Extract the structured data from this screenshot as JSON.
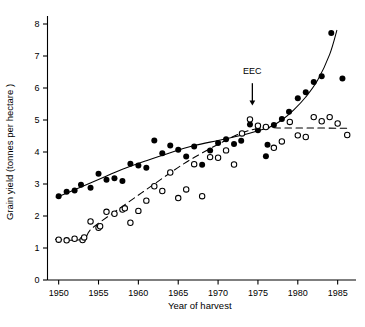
{
  "chart_data": {
    "type": "scatter",
    "title": "",
    "xlabel": "Year of harvest",
    "ylabel": "Grain yield (tonnes per hectare )",
    "xlim": [
      1948.6,
      1986.8
    ],
    "ylim": [
      0,
      8
    ],
    "grid": false,
    "legend_position": "none",
    "xticks": [
      1950,
      1955,
      1960,
      1965,
      1970,
      1975,
      1980,
      1985
    ],
    "xtick_labels": [
      "1950",
      "1955",
      "1960",
      "1965",
      "1970",
      "1975",
      "1980",
      "1985"
    ],
    "yticks": [
      0,
      1,
      2,
      3,
      4,
      5,
      6,
      7,
      8
    ],
    "ytick_labels": [
      "0",
      "1",
      "2",
      "3",
      "4",
      "5",
      "6",
      "7",
      "8"
    ],
    "annotations": [
      {
        "text": "EEC",
        "x": 1974.3,
        "y": 6.45,
        "arrow": "down",
        "arrow_from_y": 6.15,
        "arrow_to_y": 5.45
      }
    ],
    "series": [
      {
        "name": "filled-circles",
        "marker": "filled-circle",
        "marker_color": "#000000",
        "points": [
          [
            1950.0,
            2.62
          ],
          [
            1951.0,
            2.76
          ],
          [
            1952.0,
            2.8
          ],
          [
            1952.8,
            2.98
          ],
          [
            1954.0,
            2.88
          ],
          [
            1955.0,
            3.32
          ],
          [
            1956.0,
            3.13
          ],
          [
            1957.0,
            3.18
          ],
          [
            1958.0,
            3.09
          ],
          [
            1959.0,
            3.63
          ],
          [
            1960.0,
            3.58
          ],
          [
            1961.0,
            3.51
          ],
          [
            1962.0,
            4.36
          ],
          [
            1963.0,
            3.96
          ],
          [
            1964.0,
            4.2
          ],
          [
            1965.0,
            4.07
          ],
          [
            1966.0,
            3.86
          ],
          [
            1967.0,
            4.17
          ],
          [
            1968.0,
            3.6
          ],
          [
            1969.0,
            4.05
          ],
          [
            1970.0,
            4.28
          ],
          [
            1971.0,
            4.4
          ],
          [
            1972.0,
            4.25
          ],
          [
            1972.9,
            4.35
          ],
          [
            1974.0,
            4.86
          ],
          [
            1975.0,
            4.68
          ],
          [
            1976.0,
            3.87
          ],
          [
            1976.2,
            4.23
          ],
          [
            1977.0,
            4.84
          ],
          [
            1978.0,
            5.03
          ],
          [
            1978.9,
            5.26
          ],
          [
            1980.0,
            5.68
          ],
          [
            1981.0,
            5.87
          ],
          [
            1982.0,
            6.19
          ],
          [
            1983.0,
            6.37
          ],
          [
            1984.2,
            7.72
          ],
          [
            1985.6,
            6.3
          ]
        ]
      },
      {
        "name": "open-circles",
        "marker": "open-circle",
        "marker_color": "#000000",
        "points": [
          [
            1950.0,
            1.26
          ],
          [
            1951.0,
            1.24
          ],
          [
            1952.0,
            1.29
          ],
          [
            1953.0,
            1.25
          ],
          [
            1953.2,
            1.33
          ],
          [
            1954.0,
            1.83
          ],
          [
            1955.0,
            1.63
          ],
          [
            1955.2,
            1.68
          ],
          [
            1956.0,
            2.13
          ],
          [
            1957.0,
            2.07
          ],
          [
            1958.0,
            2.2
          ],
          [
            1958.3,
            2.24
          ],
          [
            1959.0,
            1.79
          ],
          [
            1960.0,
            2.16
          ],
          [
            1961.0,
            2.48
          ],
          [
            1962.0,
            2.93
          ],
          [
            1963.0,
            2.78
          ],
          [
            1964.0,
            3.36
          ],
          [
            1965.0,
            2.56
          ],
          [
            1966.0,
            2.83
          ],
          [
            1967.0,
            3.62
          ],
          [
            1968.0,
            2.62
          ],
          [
            1969.0,
            3.84
          ],
          [
            1970.0,
            3.82
          ],
          [
            1971.0,
            4.05
          ],
          [
            1972.0,
            3.61
          ],
          [
            1973.0,
            4.58
          ],
          [
            1974.0,
            5.02
          ],
          [
            1975.0,
            4.82
          ],
          [
            1976.0,
            4.78
          ],
          [
            1977.0,
            4.13
          ],
          [
            1978.0,
            4.33
          ],
          [
            1979.0,
            4.94
          ],
          [
            1980.0,
            4.52
          ],
          [
            1981.0,
            4.47
          ],
          [
            1982.0,
            5.09
          ],
          [
            1983.0,
            4.96
          ],
          [
            1984.0,
            5.09
          ],
          [
            1985.0,
            4.89
          ],
          [
            1986.2,
            4.53
          ]
        ]
      }
    ],
    "fitted_curves": [
      {
        "name": "solid-trend-line",
        "style": "solid",
        "color": "#000000",
        "points": [
          [
            1949.7,
            2.58
          ],
          [
            1952,
            2.82
          ],
          [
            1955,
            3.14
          ],
          [
            1958,
            3.46
          ],
          [
            1961,
            3.73
          ],
          [
            1964,
            3.98
          ],
          [
            1967,
            4.2
          ],
          [
            1970,
            4.36
          ],
          [
            1973,
            4.52
          ],
          [
            1975,
            4.66
          ],
          [
            1976.5,
            4.78
          ],
          [
            1978,
            5.0
          ],
          [
            1979.5,
            5.32
          ],
          [
            1981,
            5.72
          ],
          [
            1982.5,
            6.25
          ],
          [
            1984,
            7.05
          ],
          [
            1984.9,
            7.8
          ]
        ]
      },
      {
        "name": "dashed-trend-line",
        "style": "dashed",
        "color": "#000000",
        "points": [
          [
            1949.6,
            1.27
          ],
          [
            1953.0,
            1.27
          ],
          [
            1954.2,
            1.62
          ],
          [
            1958,
            2.3
          ],
          [
            1962,
            3.0
          ],
          [
            1966,
            3.68
          ],
          [
            1970,
            4.24
          ],
          [
            1973,
            4.6
          ],
          [
            1975.5,
            4.75
          ],
          [
            1978,
            4.75
          ],
          [
            1982,
            4.75
          ],
          [
            1986.4,
            4.74
          ]
        ]
      }
    ]
  }
}
